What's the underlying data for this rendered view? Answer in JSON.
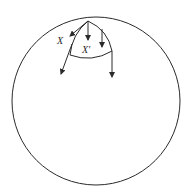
{
  "diagram": {
    "labels": {
      "x": "X",
      "x_prime": "X'"
    },
    "elements": [
      "outer-circle",
      "inner-cap-region",
      "vector-arrows"
    ],
    "colors": {
      "stroke": "#2a2a2a",
      "background": "#ffffff"
    }
  }
}
